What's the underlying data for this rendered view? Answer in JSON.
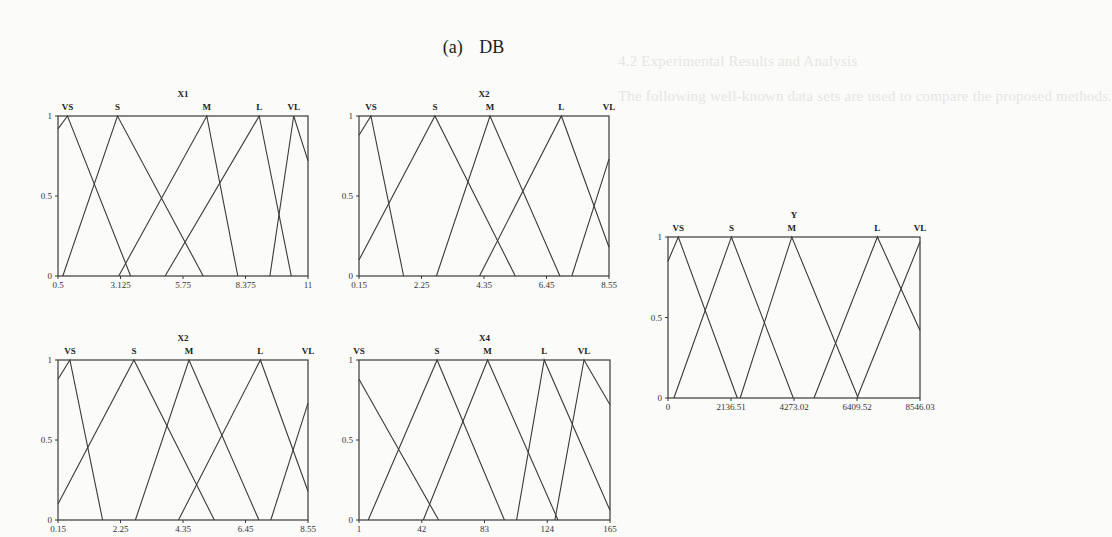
{
  "figure": {
    "label": "(a)",
    "dataset": "DB"
  },
  "background_text": [
    "4.2  Experimental Results and Analysis",
    "The following well-known data sets are used to compare the proposed methods.",
    "(1) Mackey-Glass time series (2) Box-Jenkins gas furnace (3) probability and",
    "(4) WM weather prediction ...",
    "During stage of the WM, DB are MG, GB are divided into 5 fuzzy sets, for input/outp",
    "also for the fuzzy partition, the membership functions are triangular distributions"
  ],
  "chart_data": [
    {
      "type": "line",
      "id": "X1",
      "title": "X1",
      "xlabel": "",
      "ylabel": "membership",
      "xlim": [
        0.5,
        11
      ],
      "ylim": [
        0,
        1
      ],
      "xticks": [
        "0.5",
        "3.125",
        "5.75",
        "8.375",
        "11"
      ],
      "yticks": [
        "0",
        "0.5",
        "1"
      ],
      "legend_position": "top (term labels above peaks)",
      "grid": false,
      "series": [
        {
          "name": "VS",
          "points": [
            [
              0.5,
              0.92
            ],
            [
              0.9,
              1
            ],
            [
              3.55,
              0
            ]
          ]
        },
        {
          "name": "S",
          "points": [
            [
              0.7,
              0
            ],
            [
              3.0,
              1
            ],
            [
              6.6,
              0
            ]
          ]
        },
        {
          "name": "M",
          "points": [
            [
              3.05,
              0
            ],
            [
              6.75,
              1
            ],
            [
              8.05,
              0
            ]
          ]
        },
        {
          "name": "L",
          "points": [
            [
              5.0,
              0
            ],
            [
              8.95,
              1
            ],
            [
              10.3,
              0
            ]
          ]
        },
        {
          "name": "VL",
          "points": [
            [
              9.4,
              0
            ],
            [
              10.4,
              1
            ],
            [
              11,
              0.72
            ]
          ]
        }
      ]
    },
    {
      "type": "line",
      "id": "X2_top",
      "title": "X2",
      "xlabel": "",
      "ylabel": "membership",
      "xlim": [
        0.15,
        8.55
      ],
      "ylim": [
        0,
        1
      ],
      "xticks": [
        "0.15",
        "2.25",
        "4.35",
        "6.45",
        "8.55"
      ],
      "yticks": [
        "0",
        "0.5",
        "1"
      ],
      "legend_position": "top (term labels above peaks)",
      "grid": false,
      "series": [
        {
          "name": "VS",
          "points": [
            [
              0.15,
              0.88
            ],
            [
              0.55,
              1
            ],
            [
              1.65,
              0
            ]
          ]
        },
        {
          "name": "S",
          "points": [
            [
              0.15,
              0.1
            ],
            [
              2.7,
              1
            ],
            [
              5.4,
              0
            ]
          ]
        },
        {
          "name": "M",
          "points": [
            [
              2.75,
              0
            ],
            [
              4.55,
              1
            ],
            [
              6.9,
              0
            ]
          ]
        },
        {
          "name": "L",
          "points": [
            [
              4.2,
              0
            ],
            [
              6.95,
              1
            ],
            [
              8.55,
              0.18
            ]
          ]
        },
        {
          "name": "VL",
          "points": [
            [
              7.3,
              0
            ],
            [
              8.55,
              0.73
            ]
          ]
        }
      ]
    },
    {
      "type": "line",
      "id": "Y",
      "title": "Y",
      "xlabel": "",
      "ylabel": "membership",
      "xlim": [
        0,
        8546.03
      ],
      "ylim": [
        0,
        1
      ],
      "xticks": [
        "0",
        "2136.51",
        "4273.02",
        "6409.52",
        "8546.03"
      ],
      "yticks": [
        "0",
        "0.5",
        "1"
      ],
      "legend_position": "top (term labels above peaks)",
      "grid": false,
      "series": [
        {
          "name": "VS",
          "points": [
            [
              0,
              0.85
            ],
            [
              350,
              1
            ],
            [
              2350,
              0
            ]
          ]
        },
        {
          "name": "S",
          "points": [
            [
              200,
              0
            ],
            [
              2150,
              1
            ],
            [
              4250,
              0
            ]
          ]
        },
        {
          "name": "M",
          "points": [
            [
              2450,
              0
            ],
            [
              4200,
              1
            ],
            [
              6450,
              0
            ]
          ]
        },
        {
          "name": "L",
          "points": [
            [
              4950,
              0
            ],
            [
              7100,
              1
            ],
            [
              8546.03,
              0.42
            ]
          ]
        },
        {
          "name": "VL",
          "points": [
            [
              6409.52,
              0
            ],
            [
              8546.03,
              0.97
            ]
          ]
        }
      ]
    },
    {
      "type": "line",
      "id": "X2_bottom",
      "title": "X2",
      "xlabel": "",
      "ylabel": "membership",
      "xlim": [
        0.15,
        8.55
      ],
      "ylim": [
        0,
        1
      ],
      "xticks": [
        "0.15",
        "2.25",
        "4.35",
        "6.45",
        "8.55"
      ],
      "yticks": [
        "0",
        "0.5",
        "1"
      ],
      "legend_position": "top (term labels above peaks)",
      "grid": false,
      "series": [
        {
          "name": "VS",
          "points": [
            [
              0.15,
              0.88
            ],
            [
              0.55,
              1
            ],
            [
              1.65,
              0
            ]
          ]
        },
        {
          "name": "S",
          "points": [
            [
              0.15,
              0.1
            ],
            [
              2.7,
              1
            ],
            [
              5.4,
              0
            ]
          ]
        },
        {
          "name": "M",
          "points": [
            [
              2.75,
              0
            ],
            [
              4.55,
              1
            ],
            [
              6.9,
              0
            ]
          ]
        },
        {
          "name": "L",
          "points": [
            [
              4.2,
              0
            ],
            [
              6.95,
              1
            ],
            [
              8.55,
              0.18
            ]
          ]
        },
        {
          "name": "VL",
          "points": [
            [
              7.3,
              0
            ],
            [
              8.55,
              0.73
            ]
          ]
        }
      ]
    },
    {
      "type": "line",
      "id": "X4",
      "title": "X4",
      "xlabel": "",
      "ylabel": "membership",
      "xlim": [
        1,
        165
      ],
      "ylim": [
        0,
        1
      ],
      "xticks": [
        "1",
        "42",
        "83",
        "124",
        "165"
      ],
      "yticks": [
        "0",
        "0.5",
        "1"
      ],
      "legend_position": "top (term labels above peaks)",
      "grid": false,
      "series": [
        {
          "name": "VS",
          "points": [
            [
              1,
              0.88
            ],
            [
              53,
              0
            ]
          ]
        },
        {
          "name": "S",
          "points": [
            [
              7,
              0
            ],
            [
              52,
              1
            ],
            [
              96,
              0
            ]
          ]
        },
        {
          "name": "M",
          "points": [
            [
              43,
              0
            ],
            [
              85,
              1
            ],
            [
              131,
              0
            ]
          ]
        },
        {
          "name": "L",
          "points": [
            [
              104,
              0
            ],
            [
              122,
              1
            ],
            [
              165,
              0.06
            ]
          ]
        },
        {
          "name": "VL",
          "points": [
            [
              129,
              0
            ],
            [
              148,
              1
            ],
            [
              165,
              0.72
            ]
          ]
        }
      ]
    }
  ],
  "layout": {
    "panels": [
      {
        "id": "X1",
        "left": 58,
        "top": 116,
        "width": 250,
        "height": 160
      },
      {
        "id": "X2_top",
        "left": 359,
        "top": 116,
        "width": 250,
        "height": 160
      },
      {
        "id": "Y",
        "left": 668,
        "top": 237,
        "width": 252,
        "height": 161
      },
      {
        "id": "X2_bottom",
        "left": 58,
        "top": 360,
        "width": 250,
        "height": 160
      },
      {
        "id": "X4",
        "left": 359,
        "top": 360,
        "width": 251,
        "height": 160
      }
    ],
    "line_color": "#3a3a3a"
  }
}
